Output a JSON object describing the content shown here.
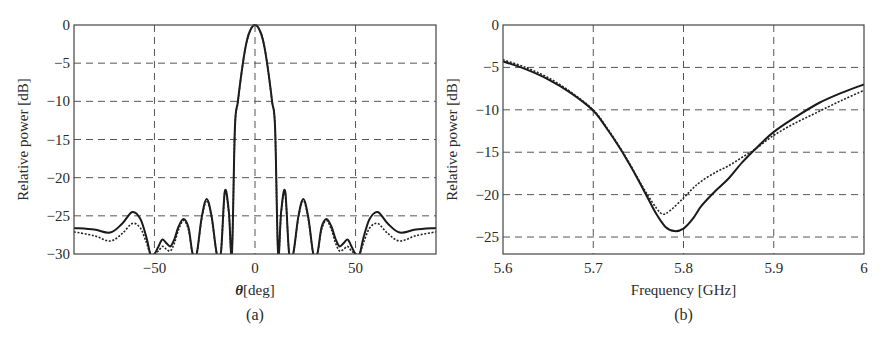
{
  "figure": {
    "panels": [
      "(a)",
      "(b)"
    ]
  },
  "chart_data": [
    {
      "type": "line",
      "caption": "(a)",
      "title": "",
      "xlabel_symbol": "θ",
      "xlabel_unit": "[deg]",
      "xlabel": "θ [deg]",
      "ylabel": "Relative power [dB]",
      "xlim": [
        -90,
        90
      ],
      "ylim": [
        -30,
        0
      ],
      "xticks": [
        -50,
        0,
        50
      ],
      "xtick_labels": [
        "−50",
        "0",
        "50"
      ],
      "yticks": [
        0,
        -5,
        -10,
        -15,
        -20,
        -25,
        -30
      ],
      "ytick_labels": [
        "0",
        "−5",
        "−10",
        "−15",
        "−20",
        "−25",
        "−30"
      ],
      "grid": true,
      "legend": null,
      "series": [
        {
          "name": "solid",
          "style": "solid",
          "x": [
            -90,
            -80,
            -72,
            -66,
            -61,
            -57,
            -54,
            -52,
            -50,
            -48,
            -46,
            -44,
            -42,
            -40,
            -38,
            -35.5,
            -33,
            -31,
            -29,
            -26.5,
            -24,
            -21.5,
            -19,
            -17,
            -15,
            -13,
            -11.5,
            -10,
            -8.5,
            -6,
            -4,
            -2,
            0,
            2,
            4,
            6,
            8.5,
            10,
            11.5,
            13,
            15,
            17,
            19,
            21.5,
            24,
            26.5,
            29,
            31,
            33,
            35.5,
            38,
            40,
            42,
            44,
            46,
            48,
            50,
            52,
            54,
            57,
            61,
            66,
            72,
            80,
            90
          ],
          "y": [
            -26.6,
            -26.8,
            -27.2,
            -26.0,
            -24.5,
            -25.4,
            -27.8,
            -30,
            -30,
            -29.0,
            -28.1,
            -28.6,
            -29.0,
            -28.0,
            -26.4,
            -25.4,
            -26.6,
            -30,
            -30,
            -25.2,
            -22.8,
            -25.2,
            -30,
            -30,
            -21.8,
            -24.5,
            -30,
            -13.5,
            -10.0,
            -5.0,
            -2.0,
            -0.5,
            0,
            -0.5,
            -2.0,
            -5.0,
            -10.0,
            -13.5,
            -30,
            -24.5,
            -21.8,
            -30,
            -30,
            -25.2,
            -22.8,
            -25.2,
            -30,
            -30,
            -26.6,
            -25.4,
            -26.4,
            -28.0,
            -29.0,
            -28.6,
            -28.1,
            -29.0,
            -30,
            -30,
            -27.8,
            -25.4,
            -24.5,
            -26.0,
            -27.2,
            -26.8,
            -26.6
          ]
        },
        {
          "name": "dotted",
          "style": "dotted",
          "x": [
            -90,
            -80,
            -72,
            -66,
            -61,
            -57,
            -54,
            -52,
            -50,
            -48,
            -46,
            -44,
            -42,
            -40,
            -38,
            -35.5,
            -33,
            -31,
            -29,
            -26.5,
            -24,
            -21.5,
            -19,
            -17,
            -15,
            -13,
            -11.5,
            -10,
            -8.5,
            -6,
            -4,
            -2,
            0,
            2,
            4,
            6,
            8.5,
            10,
            11.5,
            13,
            15,
            17,
            19,
            21.5,
            24,
            26.5,
            29,
            31,
            33,
            35.5,
            38,
            40,
            42,
            44,
            46,
            48,
            50,
            52,
            54,
            57,
            61,
            66,
            72,
            80,
            90
          ],
          "y": [
            -27.1,
            -27.6,
            -28.3,
            -27.3,
            -26.0,
            -26.6,
            -28.5,
            -30,
            -30,
            -29.6,
            -29.0,
            -29.4,
            -29.6,
            -28.5,
            -26.8,
            -25.6,
            -26.9,
            -30,
            -30,
            -25.4,
            -23.0,
            -25.4,
            -30,
            -30,
            -22.0,
            -24.7,
            -30,
            -13.6,
            -10.1,
            -5.0,
            -2.0,
            -0.5,
            0,
            -0.5,
            -2.0,
            -5.0,
            -10.1,
            -13.6,
            -30,
            -24.7,
            -22.0,
            -30,
            -30,
            -25.4,
            -23.0,
            -25.4,
            -30,
            -30,
            -26.9,
            -25.6,
            -26.8,
            -28.5,
            -29.6,
            -29.4,
            -29.0,
            -29.6,
            -30,
            -30,
            -28.5,
            -26.6,
            -26.0,
            -27.3,
            -28.3,
            -27.6,
            -27.1
          ]
        }
      ]
    },
    {
      "type": "line",
      "caption": "(b)",
      "title": "",
      "xlabel": "Frequency [GHz]",
      "ylabel": "Relative power [dB]",
      "xlim": [
        5.6,
        6.0
      ],
      "ylim": [
        -27,
        0
      ],
      "xticks": [
        5.6,
        5.7,
        5.8,
        5.9,
        6.0
      ],
      "xtick_labels": [
        "5.6",
        "5.7",
        "5.8",
        "5.9",
        "6"
      ],
      "yticks": [
        0,
        -5,
        -10,
        -15,
        -20,
        -25
      ],
      "ytick_labels": [
        "0",
        "−5",
        "−10",
        "−15",
        "−20",
        "−25"
      ],
      "grid": true,
      "legend": null,
      "series": [
        {
          "name": "solid",
          "style": "solid",
          "x": [
            5.6,
            5.625,
            5.65,
            5.675,
            5.7,
            5.715,
            5.73,
            5.74,
            5.75,
            5.76,
            5.77,
            5.78,
            5.79,
            5.8,
            5.81,
            5.82,
            5.835,
            5.85,
            5.865,
            5.88,
            5.9,
            5.925,
            5.95,
            5.975,
            6.0
          ],
          "y": [
            -4.3,
            -5.2,
            -6.4,
            -8.0,
            -10.1,
            -12.2,
            -14.6,
            -16.4,
            -18.3,
            -20.3,
            -22.3,
            -23.8,
            -24.3,
            -24.0,
            -22.9,
            -21.3,
            -19.6,
            -18.1,
            -16.2,
            -14.6,
            -12.6,
            -10.8,
            -9.2,
            -8.0,
            -7.0
          ]
        },
        {
          "name": "dotted",
          "style": "dotted",
          "x": [
            5.6,
            5.625,
            5.65,
            5.675,
            5.7,
            5.715,
            5.73,
            5.74,
            5.75,
            5.76,
            5.77,
            5.777,
            5.785,
            5.8,
            5.81,
            5.82,
            5.835,
            5.85,
            5.865,
            5.88,
            5.9,
            5.925,
            5.95,
            5.975,
            6.0
          ],
          "y": [
            -4.1,
            -5.0,
            -6.2,
            -7.9,
            -10.0,
            -12.1,
            -14.5,
            -16.3,
            -18.2,
            -20.0,
            -21.6,
            -22.3,
            -21.9,
            -20.4,
            -19.3,
            -18.4,
            -17.4,
            -16.6,
            -15.6,
            -14.6,
            -13.0,
            -11.5,
            -10.2,
            -8.9,
            -7.7
          ]
        }
      ]
    }
  ]
}
